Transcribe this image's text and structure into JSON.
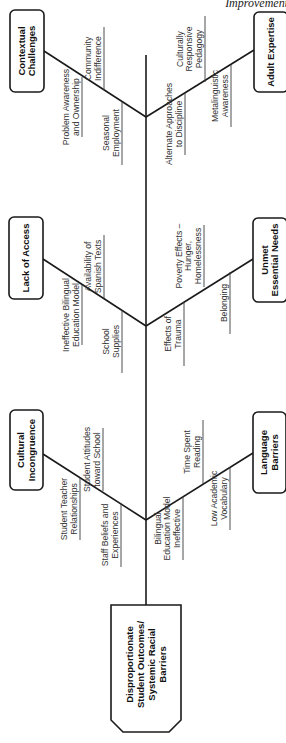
{
  "running_header": "Improvement",
  "head": {
    "lines": [
      "Disproportionate",
      "Student Outcomes/",
      "Systemic Racial",
      "Barriers"
    ],
    "box": {
      "x": 111,
      "y": 605,
      "w": 70,
      "h": 127,
      "bevel": 12
    }
  },
  "spine": {
    "x": 146,
    "y1": 55,
    "y2": 605
  },
  "categories": [
    {
      "id": "contextual-challenges",
      "lines": [
        "Contextual",
        "Challenges"
      ],
      "side": "left",
      "box": {
        "x": 10,
        "y": 10,
        "w": 34,
        "h": 82
      },
      "junction": {
        "x": 146,
        "y": 117
      },
      "branch_start": {
        "x": 44,
        "y": 51
      },
      "causes": [
        {
          "lines": [
            "Community",
            "Indifference"
          ],
          "line": {
            "x": 104,
            "y1": 27,
            "y2": 90
          }
        },
        {
          "lines": [
            "Problem Awareness",
            "and Ownership"
          ],
          "line": {
            "x": 82,
            "y1": 77,
            "y2": 137
          }
        },
        {
          "lines": [
            "Seasonal",
            "Employment"
          ],
          "line": {
            "x": 122,
            "y1": 101,
            "y2": 165
          }
        }
      ]
    },
    {
      "id": "adult-expertise",
      "lines": [
        "Adult Expertise"
      ],
      "side": "right",
      "box": {
        "x": 254,
        "y": 12,
        "w": 34,
        "h": 80
      },
      "junction": {
        "x": 146,
        "y": 117
      },
      "branch_start": {
        "x": 254,
        "y": 50
      },
      "causes": [
        {
          "lines": [
            "Culturally",
            "Responsive",
            "Pedagogy"
          ],
          "line": {
            "x": 205,
            "y1": 16,
            "y2": 82
          }
        },
        {
          "lines": [
            "Alternate Approaches",
            "to Discipline"
          ],
          "line": {
            "x": 185,
            "y1": 93,
            "y2": 155
          }
        },
        {
          "lines": [
            "Metalinguistic",
            "Awareness"
          ],
          "line": {
            "x": 231,
            "y1": 65,
            "y2": 127
          }
        }
      ]
    },
    {
      "id": "lack-of-access",
      "lines": [
        "Lack of Access"
      ],
      "side": "left",
      "box": {
        "x": 9,
        "y": 217,
        "w": 34,
        "h": 82
      },
      "junction": {
        "x": 146,
        "y": 326
      },
      "branch_start": {
        "x": 43,
        "y": 259
      },
      "causes": [
        {
          "lines": [
            "Availability of",
            "Spanish Texts"
          ],
          "line": {
            "x": 104,
            "y1": 235,
            "y2": 298
          }
        },
        {
          "lines": [
            "Ineffective Bilingual",
            "Education Model"
          ],
          "line": {
            "x": 82,
            "y1": 285,
            "y2": 345
          }
        },
        {
          "lines": [
            "School",
            "Supplies"
          ],
          "line": {
            "x": 122,
            "y1": 310,
            "y2": 373
          }
        }
      ]
    },
    {
      "id": "unmet-essential-needs",
      "lines": [
        "Unmet",
        "Essential Needs"
      ],
      "side": "right",
      "box": {
        "x": 253,
        "y": 218,
        "w": 34,
        "h": 84
      },
      "junction": {
        "x": 146,
        "y": 326
      },
      "branch_start": {
        "x": 253,
        "y": 259
      },
      "causes": [
        {
          "lines": [
            "Poverty Effects –",
            "Hunger,",
            "Homelessness"
          ],
          "line": {
            "x": 204,
            "y1": 225,
            "y2": 287
          }
        },
        {
          "lines": [
            "Effects of",
            "Trauma"
          ],
          "line": {
            "x": 184,
            "y1": 302,
            "y2": 366
          }
        },
        {
          "lines": [
            "Belonging"
          ],
          "line": {
            "x": 230,
            "y1": 272,
            "y2": 334
          }
        }
      ]
    },
    {
      "id": "cultural-incongruence",
      "lines": [
        "Cultural",
        "Incongruence"
      ],
      "side": "left",
      "box": {
        "x": 10,
        "y": 410,
        "w": 33,
        "h": 80
      },
      "junction": {
        "x": 146,
        "y": 520
      },
      "branch_start": {
        "x": 43,
        "y": 454
      },
      "causes": [
        {
          "lines": [
            "Student Attitudes",
            "toward School"
          ],
          "line": {
            "x": 103,
            "y1": 428,
            "y2": 491
          }
        },
        {
          "lines": [
            "Student Teacher",
            "Relationships"
          ],
          "line": {
            "x": 80,
            "y1": 478,
            "y2": 540
          }
        },
        {
          "lines": [
            "Staff Beliefs and",
            "Experiences"
          ],
          "line": {
            "x": 121,
            "y1": 503,
            "y2": 567
          }
        }
      ]
    },
    {
      "id": "language-barriers",
      "lines": [
        "Language",
        "Barriers"
      ],
      "side": "right",
      "box": {
        "x": 253,
        "y": 412,
        "w": 33,
        "h": 81
      },
      "junction": {
        "x": 146,
        "y": 520
      },
      "branch_start": {
        "x": 253,
        "y": 453
      },
      "causes": [
        {
          "lines": [
            "Time Spent",
            "Reading"
          ],
          "line": {
            "x": 203,
            "y1": 420,
            "y2": 484
          }
        },
        {
          "lines": [
            "Bilingual",
            "Education Model",
            "Ineffective"
          ],
          "line": {
            "x": 183,
            "y1": 497,
            "y2": 560
          }
        },
        {
          "lines": [
            "Low Academic",
            "Vocabulary"
          ],
          "line": {
            "x": 230,
            "y1": 467,
            "y2": 530
          }
        }
      ]
    }
  ]
}
